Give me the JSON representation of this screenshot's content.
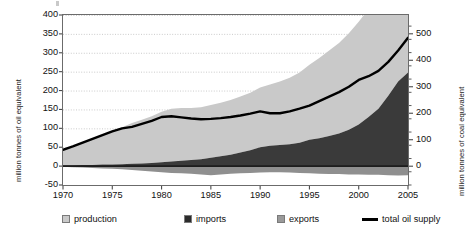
{
  "axes": {
    "left_title": "million tonnes of oil equivalent",
    "right_title": "million tonnes of coal equivalent",
    "left_ticks": [
      "400",
      "350",
      "300",
      "250",
      "200",
      "150",
      "100",
      "50",
      "0",
      "-50"
    ],
    "right_ticks": [
      "500",
      "400",
      "300",
      "200",
      "100",
      "0"
    ],
    "x_ticks": [
      "1970",
      "1975",
      "1980",
      "1985",
      "1990",
      "1995",
      "2000",
      "2005"
    ]
  },
  "legend": {
    "items": [
      {
        "label": "production",
        "type": "swatch",
        "color": "#c9c9c9"
      },
      {
        "label": "imports",
        "type": "swatch",
        "color": "#2b2b2b"
      },
      {
        "label": "exports",
        "type": "swatch",
        "color": "#9a9a9a"
      },
      {
        "label": "total oil supply",
        "type": "line",
        "color": "#000000"
      }
    ]
  },
  "colors": {
    "production": "#c9c9c9",
    "imports": "#3a3a3a",
    "exports": "#8f8f8f",
    "total_line": "#000000",
    "gridline": "#b4b4b4",
    "frame": "#6b6b6b",
    "background": "#ffffff"
  },
  "chart_data": {
    "type": "area",
    "title": "",
    "subtitle": "",
    "xlabel": "",
    "ylabel": "million tonnes of oil equivalent",
    "y2label": "million tonnes of coal equivalent",
    "xlim": [
      1970,
      2005
    ],
    "ylim": [
      -50,
      400
    ],
    "y2lim": [
      -71,
      571
    ],
    "ytick_step": 50,
    "y2tick_step": 100,
    "xtick_step": 5,
    "grid": true,
    "legend_position": "bottom",
    "note": "Stacked areas: imports drawn first from zero, production stacked above imports; exports plotted as a negative band below zero. The total oil supply line is an independent series.",
    "x": [
      1970,
      1971,
      1972,
      1973,
      1974,
      1975,
      1976,
      1977,
      1978,
      1979,
      1980,
      1981,
      1982,
      1983,
      1984,
      1985,
      1986,
      1987,
      1988,
      1989,
      1990,
      1991,
      1992,
      1993,
      1994,
      1995,
      1996,
      1997,
      1998,
      1999,
      2000,
      2001,
      2002,
      2003,
      2004,
      2005
    ],
    "series": [
      {
        "name": "production",
        "color": "#c9c9c9",
        "values": [
          40,
          48,
          58,
          68,
          78,
          88,
          98,
          108,
          116,
          124,
          134,
          140,
          140,
          138,
          138,
          140,
          142,
          145,
          148,
          152,
          158,
          162,
          168,
          176,
          186,
          198,
          212,
          226,
          240,
          256,
          272,
          286,
          300,
          320,
          346,
          330
        ]
      },
      {
        "name": "imports",
        "color": "#3a3a3a",
        "values": [
          2,
          2,
          3,
          3,
          4,
          4,
          5,
          6,
          7,
          8,
          10,
          12,
          14,
          16,
          18,
          22,
          26,
          30,
          36,
          42,
          50,
          54,
          56,
          58,
          62,
          70,
          74,
          80,
          86,
          96,
          110,
          130,
          152,
          186,
          224,
          248
        ]
      },
      {
        "name": "exports",
        "color": "#8f8f8f",
        "values": [
          -2,
          -3,
          -4,
          -5,
          -6,
          -7,
          -8,
          -10,
          -12,
          -14,
          -16,
          -18,
          -19,
          -20,
          -22,
          -24,
          -22,
          -20,
          -19,
          -18,
          -17,
          -16,
          -16,
          -17,
          -18,
          -19,
          -20,
          -21,
          -21,
          -22,
          -22,
          -23,
          -23,
          -24,
          -25,
          -24
        ]
      },
      {
        "name": "total oil supply",
        "color": "#000000",
        "type": "line",
        "values": [
          43,
          52,
          62,
          72,
          82,
          92,
          100,
          104,
          112,
          120,
          130,
          132,
          129,
          126,
          124,
          125,
          127,
          130,
          134,
          139,
          145,
          140,
          140,
          145,
          152,
          160,
          172,
          184,
          196,
          210,
          228,
          238,
          252,
          276,
          306,
          340
        ]
      }
    ]
  }
}
